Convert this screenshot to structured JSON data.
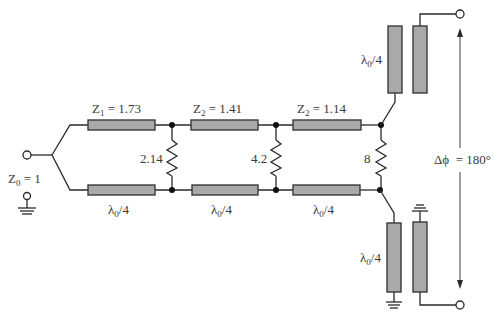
{
  "diagram": {
    "input": {
      "label_main": "Z",
      "label_sub": "0",
      "label_value": " = 1"
    },
    "sections": [
      {
        "top_label_main": "Z",
        "top_label_sub": "1",
        "top_label_value": " = 1.73",
        "bottom_label_main": "λ",
        "bottom_label_sub": "0",
        "bottom_label_value": "/4",
        "resistor": "2.14"
      },
      {
        "top_label_main": "Z",
        "top_label_sub": "2",
        "top_label_value": " = 1.41",
        "bottom_label_main": "λ",
        "bottom_label_sub": "0",
        "bottom_label_value": "/4",
        "resistor": "4.2"
      },
      {
        "top_label_main": "Z",
        "top_label_sub": "2",
        "top_label_value": " = 1.14",
        "bottom_label_main": "λ",
        "bottom_label_sub": "0",
        "bottom_label_value": "/4",
        "resistor": "8"
      }
    ],
    "couplers": {
      "top": {
        "label_main": "λ",
        "label_sub": "0",
        "label_value": "/4"
      },
      "bottom": {
        "label_main": "λ",
        "label_sub": "0",
        "label_value": "/4"
      }
    },
    "phase": {
      "label": "Δϕ  = 180°"
    },
    "colors": {
      "line_fill": "#a9a9a9",
      "stroke": "#2a2a2a",
      "text": "#3a3a3a",
      "background": "#ffffff"
    }
  }
}
